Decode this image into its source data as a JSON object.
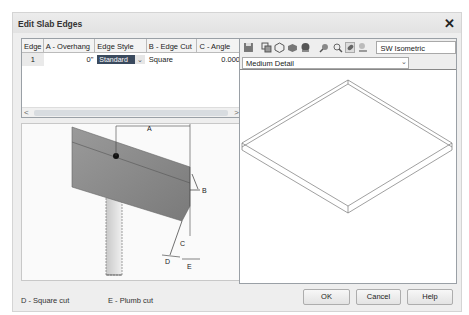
{
  "dialog": {
    "title": "Edit Slab Edges",
    "close_icon": "✕"
  },
  "grid": {
    "columns": [
      "Edge",
      "A - Overhang",
      "Edge Style",
      "B - Edge Cut",
      "C - Angle"
    ],
    "rows": [
      {
        "edge": "1",
        "overhang": "0\"",
        "edge_style": "Standard",
        "edge_cut": "Square",
        "angle": "0.000"
      }
    ],
    "scroll_left": "<",
    "scroll_right": ">"
  },
  "diagram": {
    "labels": {
      "A": "A",
      "B": "B",
      "C": "C",
      "D": "D",
      "E": "E"
    }
  },
  "viewer": {
    "toolbar_icons": [
      "save-icon",
      "copy-view-icon",
      "wireframe-box-icon",
      "shaded-box-icon",
      "globe-render-icon",
      "zoom-extents-icon",
      "zoom-window-icon",
      "orbit-icon",
      "lighting-icon"
    ],
    "view_direction": "SW Isometric",
    "detail_level": "Medium Detail",
    "detail_arrow": "⌄"
  },
  "footer": {
    "note_d": "D - Square cut",
    "note_e": "E - Plumb cut",
    "ok_label": "OK",
    "cancel_label": "Cancel",
    "help_label": "Help"
  }
}
